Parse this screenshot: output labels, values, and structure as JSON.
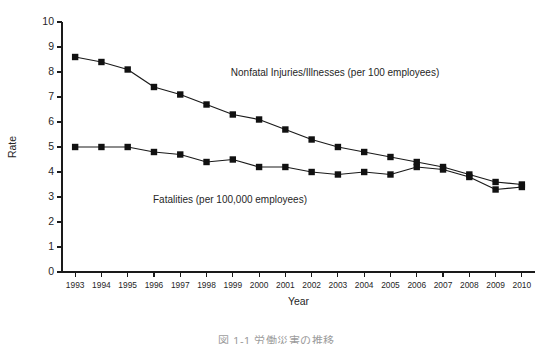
{
  "chart_data": {
    "type": "line",
    "title": "",
    "xlabel": "Year",
    "ylabel": "Rate",
    "ylim": [
      0,
      10
    ],
    "ytick_labels": [
      "0",
      "1",
      "2",
      "3",
      "4",
      "5",
      "6",
      "7",
      "8",
      "9",
      "10"
    ],
    "grid": false,
    "legend_position": "inline-annotations",
    "categories": [
      "1993",
      "1994",
      "1995",
      "1996",
      "1997",
      "1998",
      "1999",
      "2000",
      "2001",
      "2002",
      "2003",
      "2004",
      "2005",
      "2006",
      "2007",
      "2008",
      "2009",
      "2010"
    ],
    "series": [
      {
        "name": "Nonfatal Injuries/Illnesses (per 100 employees)",
        "label": "Nonfatal Injuries/Illnesses (per 100 employees)",
        "values": [
          8.6,
          8.4,
          8.1,
          7.4,
          7.1,
          6.7,
          6.3,
          6.1,
          5.7,
          5.3,
          5.0,
          4.8,
          4.6,
          4.4,
          4.2,
          3.9,
          3.6,
          3.5
        ]
      },
      {
        "name": "Fatalities (per 100,000 employees)",
        "label": "Fatalities (per 100,000 employees)",
        "values": [
          5.0,
          5.0,
          5.0,
          4.8,
          4.7,
          4.4,
          4.5,
          4.2,
          4.2,
          4.0,
          3.9,
          4.0,
          3.9,
          4.2,
          4.1,
          3.8,
          3.3,
          3.4
        ]
      }
    ]
  },
  "footer": {
    "caption": "図 1-1  労働災害の推移"
  }
}
